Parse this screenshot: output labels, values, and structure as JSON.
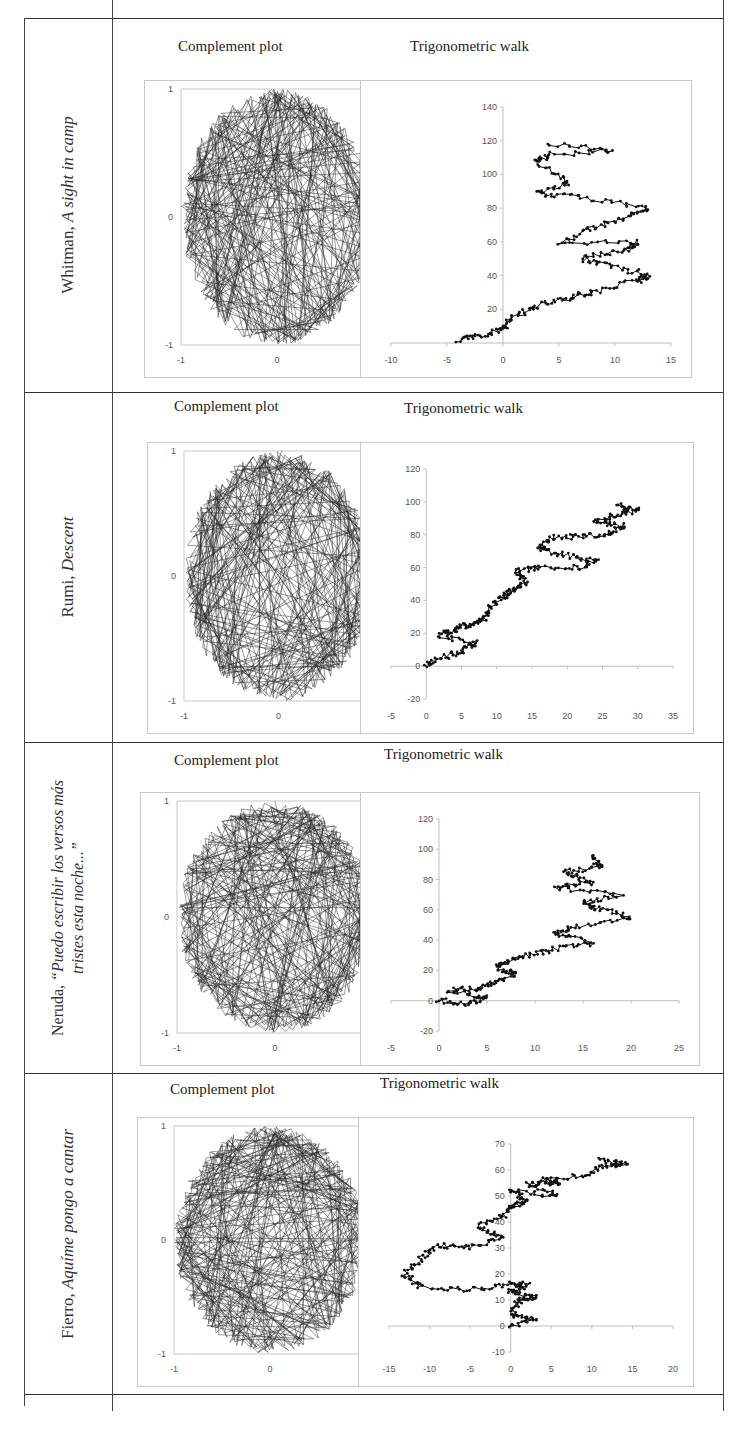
{
  "table": {
    "rows": [
      {
        "author": "Whitman, ",
        "title": "A sight in camp",
        "title2": "",
        "complement_caption": "Complement plot",
        "walk_caption": "Trigonometric walk"
      },
      {
        "author": "Rumi, ",
        "title": "Descent",
        "title2": "",
        "complement_caption": "Complement plot",
        "walk_caption": "Trigonometric walk"
      },
      {
        "author": "Neruda, ",
        "title": "“Puedo escribir los versos más",
        "title2": "tristes esta noche...”",
        "complement_caption": "Complement plot",
        "walk_caption": "Trigonometric walk"
      },
      {
        "author": "Fierro, ",
        "title": "Aquíme pongo a cantar",
        "title2": "",
        "complement_caption": "Complement plot",
        "walk_caption": "Trigonometric walk"
      }
    ]
  },
  "chart_data": [
    {
      "type": "line",
      "title": "Complement plot",
      "poem": "Whitman, A sight in camp",
      "description": "Dense chord web connecting points on the unit circle",
      "xlim": [
        -1,
        1
      ],
      "ylim": [
        -1,
        1
      ],
      "xticks": [
        "-1",
        "0",
        "1"
      ],
      "yticks": [
        "-1",
        "0",
        "1"
      ]
    },
    {
      "type": "scatter",
      "title": "Trigonometric walk",
      "poem": "Whitman, A sight in camp",
      "xlim": [
        -10,
        15
      ],
      "ylim": [
        0,
        140
      ],
      "xticks": [
        "-10",
        "-5",
        "0",
        "5",
        "10",
        "15"
      ],
      "yticks": [
        "20",
        "40",
        "60",
        "80",
        "100",
        "120",
        "140"
      ],
      "x": [
        -4,
        -2,
        0,
        1,
        3,
        6,
        8,
        12,
        13,
        9,
        7,
        11,
        12,
        5,
        8,
        11,
        13,
        7,
        3,
        6,
        3,
        4,
        10,
        4
      ],
      "y": [
        2,
        4,
        8,
        16,
        22,
        27,
        30,
        37,
        40,
        47,
        50,
        55,
        60,
        60,
        68,
        75,
        80,
        86,
        89,
        95,
        107,
        112,
        114,
        118
      ]
    },
    {
      "type": "line",
      "title": "Complement plot",
      "poem": "Rumi, Descent",
      "xlim": [
        -1,
        1
      ],
      "ylim": [
        -1,
        1
      ],
      "xticks": [
        "-1",
        "0",
        "1"
      ],
      "yticks": [
        "-1",
        "0",
        "1"
      ]
    },
    {
      "type": "scatter",
      "title": "Trigonometric walk",
      "poem": "Rumi, Descent",
      "xlim": [
        -5,
        35
      ],
      "ylim": [
        -20,
        120
      ],
      "xticks": [
        "-5",
        "0",
        "5",
        "10",
        "15",
        "20",
        "25",
        "30",
        "35"
      ],
      "yticks": [
        "-20",
        "0",
        "20",
        "40",
        "60",
        "80",
        "100",
        "120"
      ],
      "x": [
        0,
        2,
        5,
        7,
        2,
        4,
        6,
        8,
        9,
        11,
        12,
        14,
        13,
        16,
        22,
        24,
        19,
        16,
        18,
        22,
        26,
        28,
        24,
        27,
        30,
        27
      ],
      "y": [
        0,
        5,
        9,
        14,
        18,
        22,
        25,
        28,
        35,
        42,
        46,
        50,
        58,
        60,
        60,
        64,
        68,
        72,
        78,
        79,
        80,
        85,
        88,
        92,
        95,
        98
      ]
    },
    {
      "type": "line",
      "title": "Complement plot",
      "poem": "Neruda, Puedo escribir los versos más tristes esta noche...",
      "xlim": [
        -1,
        1
      ],
      "ylim": [
        -1,
        1
      ],
      "xticks": [
        "-1",
        "0",
        "1"
      ],
      "yticks": [
        "-1",
        "0",
        "1"
      ]
    },
    {
      "type": "scatter",
      "title": "Trigonometric walk",
      "poem": "Neruda, Puedo escribir los versos más tristes esta noche...",
      "xlim": [
        -5,
        25
      ],
      "ylim": [
        -20,
        120
      ],
      "xticks": [
        "-5",
        "0",
        "5",
        "10",
        "15",
        "20",
        "25"
      ],
      "yticks": [
        "-20",
        "0",
        "20",
        "40",
        "60",
        "80",
        "100",
        "120"
      ],
      "x": [
        0,
        3,
        5,
        1,
        4,
        6,
        8,
        6,
        7,
        9,
        12,
        16,
        12,
        14,
        20,
        17,
        15,
        19,
        12,
        16,
        13,
        17,
        16
      ],
      "y": [
        0,
        -2,
        2,
        7,
        8,
        12,
        18,
        22,
        26,
        30,
        34,
        38,
        45,
        48,
        55,
        60,
        65,
        70,
        75,
        78,
        85,
        88,
        95
      ]
    },
    {
      "type": "line",
      "title": "Complement plot",
      "poem": "Fierro, Aquíme pongo a cantar",
      "xlim": [
        -1,
        1
      ],
      "ylim": [
        -1,
        1
      ],
      "xticks": [
        "-1",
        "0",
        "1"
      ],
      "yticks": [
        "-1",
        "0",
        "1"
      ]
    },
    {
      "type": "scatter",
      "title": "Trigonometric walk",
      "poem": "Fierro, Aquíme pongo a cantar",
      "xlim": [
        -15,
        20
      ],
      "ylim": [
        -10,
        70
      ],
      "xticks": [
        "-15",
        "-10",
        "-5",
        "0",
        "5",
        "10",
        "15",
        "20"
      ],
      "yticks": [
        "-10",
        "0",
        "10",
        "20",
        "30",
        "40",
        "50",
        "60",
        "70"
      ],
      "x": [
        0,
        3,
        0,
        1,
        3,
        0,
        2,
        0,
        -5,
        -11,
        -13,
        -11,
        -9,
        -5,
        -1,
        -4,
        -1,
        0,
        2,
        0,
        6,
        2,
        6,
        4,
        9,
        12,
        14,
        11
      ],
      "y": [
        0,
        3,
        4,
        10,
        11,
        13,
        16,
        16,
        14,
        15,
        20,
        26,
        31,
        30,
        34,
        38,
        42,
        46,
        48,
        52,
        50,
        55,
        55,
        56,
        58,
        62,
        62,
        64
      ]
    }
  ]
}
